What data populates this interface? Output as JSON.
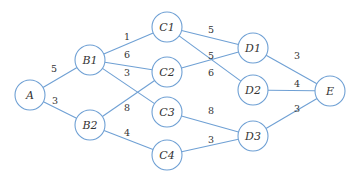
{
  "diagram": {
    "type": "weighted-directed-graph",
    "colors": {
      "edge": "#6fa0d4",
      "node_stroke": "#6fa0d4",
      "node_fill": "#ffffff",
      "text": "#333333"
    },
    "nodes": [
      {
        "id": "A",
        "label": "A",
        "x": 30,
        "y": 95
      },
      {
        "id": "B1",
        "label": "B1",
        "x": 90,
        "y": 60
      },
      {
        "id": "B2",
        "label": "B2",
        "x": 90,
        "y": 125
      },
      {
        "id": "C1",
        "label": "C1",
        "x": 167,
        "y": 27
      },
      {
        "id": "C2",
        "label": "C2",
        "x": 167,
        "y": 72
      },
      {
        "id": "C3",
        "label": "C3",
        "x": 167,
        "y": 112
      },
      {
        "id": "C4",
        "label": "C4",
        "x": 167,
        "y": 155
      },
      {
        "id": "D1",
        "label": "D1",
        "x": 253,
        "y": 48
      },
      {
        "id": "D2",
        "label": "D2",
        "x": 253,
        "y": 90
      },
      {
        "id": "D3",
        "label": "D3",
        "x": 253,
        "y": 136
      },
      {
        "id": "E",
        "label": "E",
        "x": 330,
        "y": 91
      }
    ],
    "edges": [
      {
        "from": "A",
        "to": "B1",
        "weight": "5",
        "lx": 54,
        "ly": 72
      },
      {
        "from": "A",
        "to": "B2",
        "weight": "3",
        "lx": 55,
        "ly": 104
      },
      {
        "from": "B1",
        "to": "C1",
        "weight": "1",
        "lx": 127,
        "ly": 40
      },
      {
        "from": "B1",
        "to": "C2",
        "weight": "6",
        "lx": 127,
        "ly": 58
      },
      {
        "from": "B1",
        "to": "C3",
        "weight": "3",
        "lx": 127,
        "ly": 76
      },
      {
        "from": "B2",
        "to": "C2",
        "weight": "8",
        "lx": 127,
        "ly": 111
      },
      {
        "from": "B2",
        "to": "C4",
        "weight": "4",
        "lx": 127,
        "ly": 136
      },
      {
        "from": "C1",
        "to": "D1",
        "weight": "5",
        "lx": 211,
        "ly": 33
      },
      {
        "from": "C1",
        "to": "D2",
        "weight": "6",
        "lx": 211,
        "ly": 76
      },
      {
        "from": "C2",
        "to": "D1",
        "weight": "5",
        "lx": 211,
        "ly": 59
      },
      {
        "from": "C3",
        "to": "D3",
        "weight": "8",
        "lx": 211,
        "ly": 114
      },
      {
        "from": "C4",
        "to": "D3",
        "weight": "3",
        "lx": 211,
        "ly": 143
      },
      {
        "from": "D1",
        "to": "E",
        "weight": "3",
        "lx": 297,
        "ly": 59
      },
      {
        "from": "D2",
        "to": "E",
        "weight": "4",
        "lx": 297,
        "ly": 87
      },
      {
        "from": "D3",
        "to": "E",
        "weight": "3",
        "lx": 297,
        "ly": 112
      }
    ],
    "node_radius": 15
  }
}
